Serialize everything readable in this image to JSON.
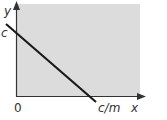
{
  "diagram": {
    "type": "line-graph-sketch",
    "region_fill": "#dcdcdc",
    "axis_color": "#333333",
    "line_color": "#1a1a1a",
    "labels": {
      "y_axis": "y",
      "x_axis": "x",
      "y_intercept": "c",
      "origin": "0",
      "x_intercept": "c/m"
    }
  }
}
